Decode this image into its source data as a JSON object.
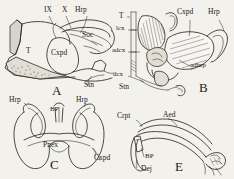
{
  "figure": {
    "kind": "scientific-line-drawing-plate",
    "background_color": "#f3f1ec",
    "ink_color": "#23201c",
    "panel_count": 4
  },
  "panels": [
    {
      "id": "A",
      "letter": "A",
      "labels": [
        {
          "key": "IX",
          "text": "IX"
        },
        {
          "key": "X",
          "text": "X"
        },
        {
          "key": "Hrp",
          "text": "Hrp"
        },
        {
          "key": "Soc",
          "text": "Soc"
        },
        {
          "key": "T",
          "text": "T"
        },
        {
          "key": "Cxpd",
          "text": "Cxpd"
        },
        {
          "key": "Stn",
          "text": "Stn"
        }
      ]
    },
    {
      "id": "B",
      "letter": "B",
      "labels": [
        {
          "key": "T",
          "text": "T"
        },
        {
          "key": "lcx",
          "text": "lcx"
        },
        {
          "key": "adcx",
          "text": "adcx"
        },
        {
          "key": "dcx",
          "text": "dcx"
        },
        {
          "key": "Stn",
          "text": "Stn"
        },
        {
          "key": "Cxpd",
          "text": "Cxpd"
        },
        {
          "key": "Hrp",
          "text": "Hrp"
        },
        {
          "key": "adhrp",
          "text": "adhrp"
        }
      ]
    },
    {
      "id": "C",
      "letter": "C",
      "labels": [
        {
          "key": "Hrp-left",
          "text": "Hrp"
        },
        {
          "key": "Hrp-right",
          "text": "Hrp"
        },
        {
          "key": "BP",
          "text": "BP"
        },
        {
          "key": "Pnex",
          "text": "Pnex"
        },
        {
          "key": "Cxpd",
          "text": "Cxpd"
        }
      ]
    },
    {
      "id": "E",
      "letter": "E",
      "labels": [
        {
          "key": "Crpt",
          "text": "Crpt"
        },
        {
          "key": "Aed",
          "text": "Aed"
        },
        {
          "key": "BP",
          "text": "BP"
        },
        {
          "key": "Dej",
          "text": "Dej"
        }
      ]
    }
  ]
}
